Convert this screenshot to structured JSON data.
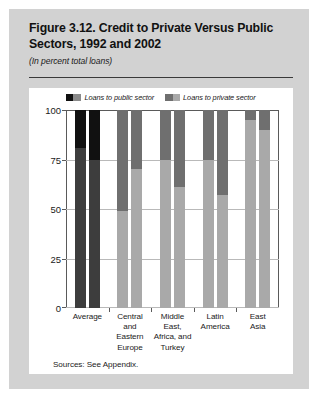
{
  "figure": {
    "title": "Figure 3.12. Credit to Private Versus Public Sectors, 1992 and 2002",
    "subtitle": "(In percent total loans)",
    "sources": "Sources: See Appendix."
  },
  "legend": {
    "items": [
      {
        "label": "Loans to public sector",
        "swatch": "public-sector-swatch"
      },
      {
        "label": "Loans to private sector",
        "swatch": "private-sector-swatch"
      }
    ]
  },
  "colors": {
    "public_dark": "#111111",
    "public_mid": "#6f6f6f",
    "private_dark": "#3d3d3d",
    "private_mid": "#8a8a8a",
    "private_light": "#a9a9a9",
    "card_background": "#ffffff",
    "figure_background": "#d2d2d2",
    "gridline": "#b9b9b9",
    "axis": "#5a5a5a"
  },
  "axis": {
    "y_ticks": [
      "0",
      "25",
      "50",
      "75",
      "100"
    ],
    "y_min": 0,
    "y_max": 100
  },
  "chart_data": {
    "type": "bar",
    "subtype": "stacked",
    "title": "Figure 3.12. Credit to Private Versus Public Sectors, 1992 and 2002",
    "subtitle": "(In percent total loans)",
    "xlabel": "",
    "ylabel": "",
    "ylim": [
      0,
      100
    ],
    "yticks": [
      0,
      25,
      50,
      75,
      100
    ],
    "grid": true,
    "legend": [
      "Loans to public sector",
      "Loans to private sector"
    ],
    "legend_position": "top-center",
    "categories": [
      "Average",
      "Central and Eastern Europe",
      "Middle East, Africa, and Turkey",
      "Latin America",
      "East Asia"
    ],
    "years": [
      "1992",
      "2002"
    ],
    "series": [
      {
        "name": "Loans to private sector",
        "values_1992": [
          81,
          49,
          75,
          75,
          95
        ],
        "values_2002": [
          75,
          70,
          61,
          57,
          90
        ]
      },
      {
        "name": "Loans to public sector",
        "values_1992": [
          19,
          51,
          25,
          25,
          5
        ],
        "values_2002": [
          25,
          30,
          39,
          43,
          10
        ]
      }
    ],
    "bars": [
      {
        "category": "Average",
        "year": "1992",
        "private": 81,
        "public": 19,
        "private_color": "#3d3d3d",
        "public_color": "#111111"
      },
      {
        "category": "Average",
        "year": "2002",
        "private": 75,
        "public": 25,
        "private_color": "#3d3d3d",
        "public_color": "#111111"
      },
      {
        "category": "Central and Eastern Europe",
        "year": "1992",
        "private": 49,
        "public": 51,
        "private_color": "#a9a9a9",
        "public_color": "#6f6f6f"
      },
      {
        "category": "Central and Eastern Europe",
        "year": "2002",
        "private": 70,
        "public": 30,
        "private_color": "#a9a9a9",
        "public_color": "#6f6f6f"
      },
      {
        "category": "Middle East, Africa, and Turkey",
        "year": "1992",
        "private": 75,
        "public": 25,
        "private_color": "#a9a9a9",
        "public_color": "#6f6f6f"
      },
      {
        "category": "Middle East, Africa, and Turkey",
        "year": "2002",
        "private": 61,
        "public": 39,
        "private_color": "#a9a9a9",
        "public_color": "#6f6f6f"
      },
      {
        "category": "Latin America",
        "year": "1992",
        "private": 75,
        "public": 25,
        "private_color": "#a9a9a9",
        "public_color": "#6f6f6f"
      },
      {
        "category": "Latin America",
        "year": "2002",
        "private": 57,
        "public": 43,
        "private_color": "#a9a9a9",
        "public_color": "#6f6f6f"
      },
      {
        "category": "East Asia",
        "year": "1992",
        "private": 95,
        "public": 5,
        "private_color": "#a9a9a9",
        "public_color": "#6f6f6f"
      },
      {
        "category": "East Asia",
        "year": "2002",
        "private": 90,
        "public": 10,
        "private_color": "#a9a9a9",
        "public_color": "#6f6f6f"
      }
    ]
  }
}
